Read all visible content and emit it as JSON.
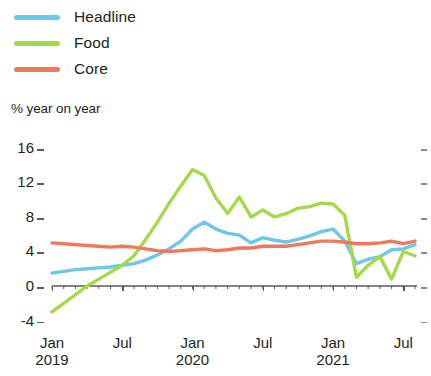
{
  "legend": {
    "position": "top-left",
    "items": [
      {
        "label": "Headline",
        "color": "#6ec6e8",
        "swatch_name": "headline-swatch"
      },
      {
        "label": "Food",
        "color": "#a5d94a",
        "swatch_name": "food-swatch"
      },
      {
        "label": "Core",
        "color": "#f0785c",
        "swatch_name": "core-swatch"
      }
    ]
  },
  "axis_title": "% year on year",
  "y_ticks": [
    "16",
    "12",
    "8",
    "4",
    "0",
    "-4"
  ],
  "x_ticks": [
    {
      "month": "Jan",
      "year": "2019"
    },
    {
      "month": "Jul",
      "year": ""
    },
    {
      "month": "Jan",
      "year": "2020"
    },
    {
      "month": "Jul",
      "year": ""
    },
    {
      "month": "Jan",
      "year": "2021"
    },
    {
      "month": "Jul",
      "year": ""
    }
  ],
  "chart_data": {
    "type": "line",
    "title": "",
    "subtitle": "",
    "xlabel": "",
    "ylabel": "% year on year",
    "ylim": [
      -4,
      16
    ],
    "xlim": [
      "2019-01",
      "2021-08"
    ],
    "grid": false,
    "legend_position": "top-left",
    "zero_line": true,
    "x": [
      "2019-01",
      "2019-02",
      "2019-03",
      "2019-04",
      "2019-05",
      "2019-06",
      "2019-07",
      "2019-08",
      "2019-09",
      "2019-10",
      "2019-11",
      "2019-12",
      "2020-01",
      "2020-02",
      "2020-03",
      "2020-04",
      "2020-05",
      "2020-06",
      "2020-07",
      "2020-08",
      "2020-09",
      "2020-10",
      "2020-11",
      "2020-12",
      "2021-01",
      "2021-02",
      "2021-03",
      "2021-04",
      "2021-05",
      "2021-06",
      "2021-07",
      "2021-08"
    ],
    "x_tick_labels": [
      "Jan 2019",
      "Jul",
      "Jan 2020",
      "Jul",
      "Jan 2021",
      "Jul"
    ],
    "series": [
      {
        "name": "Headline",
        "color": "#6ec6e8",
        "values": [
          1.5,
          1.7,
          1.9,
          2.0,
          2.1,
          2.2,
          2.4,
          2.6,
          3.0,
          3.6,
          4.3,
          5.2,
          6.6,
          7.4,
          6.6,
          6.1,
          5.9,
          5.0,
          5.6,
          5.3,
          5.1,
          5.4,
          5.8,
          6.3,
          6.6,
          5.2,
          2.6,
          3.1,
          3.4,
          4.2,
          4.3,
          4.8
        ]
      },
      {
        "name": "Food",
        "color": "#a5d94a",
        "values": [
          -3.0,
          -2.0,
          -1.0,
          0.0,
          0.8,
          1.6,
          2.4,
          3.5,
          5.4,
          7.4,
          9.6,
          11.6,
          13.5,
          12.8,
          10.2,
          8.4,
          10.3,
          8.0,
          8.8,
          8.0,
          8.4,
          9.0,
          9.2,
          9.6,
          9.5,
          8.2,
          1.0,
          2.4,
          3.4,
          0.8,
          4.0,
          3.5
        ]
      },
      {
        "name": "Core",
        "color": "#f0785c",
        "values": [
          5.0,
          4.9,
          4.8,
          4.7,
          4.6,
          4.5,
          4.6,
          4.5,
          4.3,
          4.1,
          4.0,
          4.1,
          4.2,
          4.3,
          4.1,
          4.2,
          4.4,
          4.4,
          4.6,
          4.6,
          4.6,
          4.8,
          5.0,
          5.2,
          5.2,
          5.1,
          4.9,
          4.9,
          5.0,
          5.2,
          4.9,
          5.2
        ]
      }
    ]
  },
  "geometry": {
    "plot_left": 52,
    "plot_right": 415,
    "y_zero_px": 286,
    "px_per_unit": 8.63
  }
}
